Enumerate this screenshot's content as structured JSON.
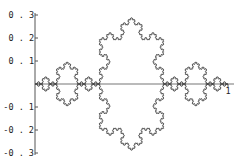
{
  "chart_data": {
    "type": "line",
    "title": "",
    "xlabel": "",
    "ylabel": "",
    "x_range": [
      0,
      1
    ],
    "ylim": [
      -0.3,
      0.3
    ],
    "grid": false,
    "legend": null,
    "x_ticks": [
      {
        "value": 1,
        "label": "1"
      }
    ],
    "y_ticks": [
      {
        "value": 0.3,
        "label": "0.3"
      },
      {
        "value": 0.2,
        "label": "0.2"
      },
      {
        "value": 0.1,
        "label": "0.1"
      },
      {
        "value": -0.1,
        "label": "-0.1"
      },
      {
        "value": -0.2,
        "label": "-0.2"
      },
      {
        "value": -0.3,
        "label": "-0.3"
      }
    ],
    "series": [
      {
        "name": "upper curve",
        "start": [
          0,
          0
        ],
        "end": [
          1,
          0
        ],
        "peak": [
          0.5,
          0.289
        ],
        "iterations": 5,
        "color": "#333333"
      },
      {
        "name": "lower curve (mirror)",
        "start": [
          0,
          0
        ],
        "end": [
          1,
          0
        ],
        "peak": [
          0.5,
          -0.289
        ],
        "iterations": 5,
        "color": "#333333"
      }
    ],
    "axis_color": "#555555"
  },
  "layout": {
    "origin_px": [
      35,
      84
    ],
    "x_unit_px": 193,
    "y_unit_px": 230,
    "y_axis_top_px": 13,
    "y_axis_bottom_px": 155,
    "x_axis_right_px": 234
  }
}
